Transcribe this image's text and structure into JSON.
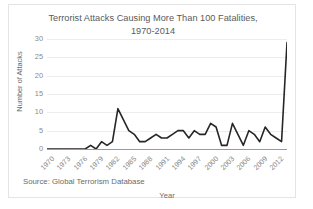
{
  "chart_data": {
    "type": "line",
    "title": "Terrorist Attacks Causing More Than 100 Fatalities, 1970-2014",
    "title_line1": "Terrorist Attacks Causing More Than 100 Fatalities,",
    "title_line2": "1970-2014",
    "xlabel": "Year",
    "ylabel": "Number of Attacks",
    "source": "Source: Global Terrorism Database",
    "ylim": [
      0,
      30
    ],
    "yticks": [
      0,
      5,
      10,
      15,
      20,
      25,
      30
    ],
    "xticks": [
      1970,
      1973,
      1976,
      1979,
      1982,
      1985,
      1988,
      1991,
      1994,
      1997,
      2000,
      2003,
      2006,
      2009,
      2012
    ],
    "xlim": [
      1970,
      2014
    ],
    "grid": true,
    "legend": "none",
    "line_color": "#262626",
    "grid_color": "#ededed",
    "axis_color": "#9a9a9a",
    "text_color": "#6b6b6b",
    "x": [
      1970,
      1971,
      1972,
      1973,
      1974,
      1975,
      1976,
      1977,
      1978,
      1979,
      1980,
      1981,
      1982,
      1983,
      1984,
      1985,
      1986,
      1987,
      1988,
      1989,
      1990,
      1991,
      1992,
      1993,
      1994,
      1995,
      1996,
      1997,
      1998,
      1999,
      2000,
      2001,
      2002,
      2003,
      2004,
      2005,
      2006,
      2007,
      2008,
      2009,
      2010,
      2011,
      2012,
      2013,
      2014
    ],
    "values": [
      0,
      0,
      0,
      0,
      0,
      0,
      0,
      0,
      1,
      0,
      2,
      1,
      2,
      11,
      8,
      5,
      4,
      2,
      2,
      3,
      4,
      3,
      3,
      4,
      5,
      5,
      3,
      5,
      4,
      4,
      7,
      6,
      1,
      1,
      7,
      4,
      1,
      5,
      4,
      2,
      6,
      4,
      3,
      2,
      29
    ]
  }
}
